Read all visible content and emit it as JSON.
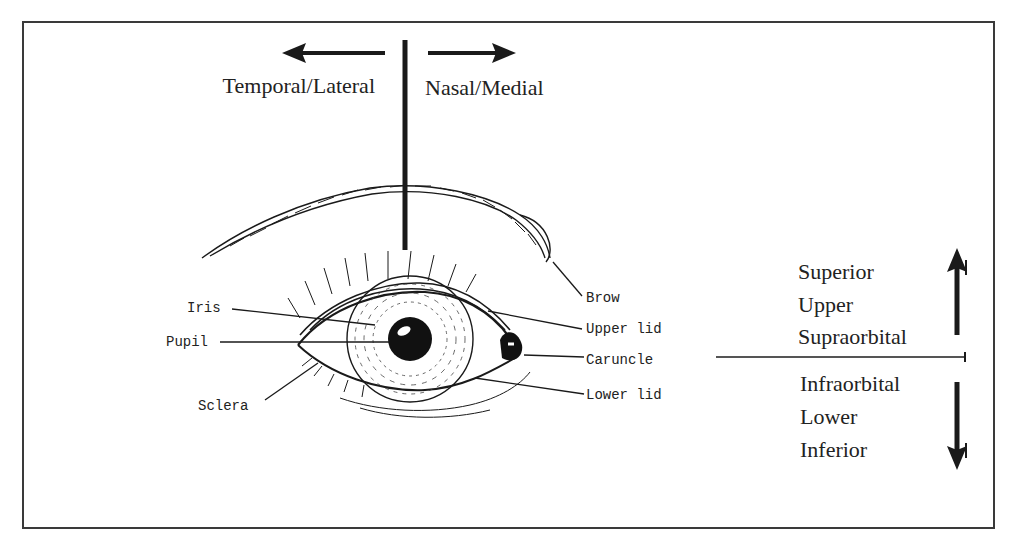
{
  "diagram": {
    "horizontal_directions": {
      "left_label": "Temporal/Lateral",
      "right_label": "Nasal/Medial"
    },
    "vertical_directions": {
      "upper_labels": [
        "Superior",
        "Upper",
        "Supraorbital"
      ],
      "lower_labels": [
        "Infraorbital",
        "Lower",
        "Inferior"
      ]
    },
    "left_callouts": [
      {
        "label": "Iris"
      },
      {
        "label": "Pupil"
      },
      {
        "label": "Sclera"
      }
    ],
    "right_callouts": [
      {
        "label": "Brow"
      },
      {
        "label": "Upper lid"
      },
      {
        "label": "Caruncle"
      },
      {
        "label": "Lower lid"
      }
    ],
    "colors": {
      "ink": "#1a1a1a",
      "frame": "#3a3a3a",
      "background": "#ffffff"
    }
  }
}
